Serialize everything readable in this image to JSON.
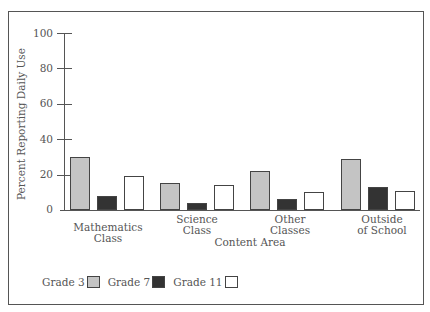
{
  "chart_data": {
    "type": "bar",
    "title": "",
    "xlabel": "Content Area",
    "ylabel": "Percent Reporting Daily Use",
    "ylim": [
      0,
      100
    ],
    "yticks": [
      0,
      20,
      40,
      60,
      80,
      100
    ],
    "grid": false,
    "legend_position": "bottom-left",
    "categories": [
      "Mathematics Class",
      "Science Class",
      "Other Classes",
      "Outside of School"
    ],
    "category_labels": [
      [
        "Mathematics",
        "Class"
      ],
      [
        "Science",
        "Class"
      ],
      [
        "Other",
        "Classes"
      ],
      [
        "Outside",
        "of School"
      ]
    ],
    "series": [
      {
        "name": "Grade 3",
        "color": "#c4c4c4",
        "values": [
          30,
          15,
          22,
          29
        ]
      },
      {
        "name": "Grade 7",
        "color": "#333333",
        "values": [
          8,
          4,
          6,
          13
        ]
      },
      {
        "name": "Grade 11",
        "color": "#ffffff",
        "values": [
          19,
          14,
          10,
          11
        ]
      }
    ]
  },
  "labels": {
    "yticks": [
      "100",
      "80",
      "60",
      "40",
      "20",
      "0"
    ],
    "ylabel": "Percent Reporting Daily Use",
    "xtitle": "Content Area",
    "legend": [
      "Grade 3",
      "Grade 7",
      "Grade 11"
    ]
  }
}
